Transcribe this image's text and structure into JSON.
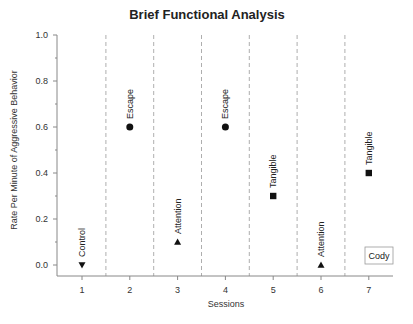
{
  "chart_data": {
    "type": "scatter",
    "title": "Brief Functional Analysis",
    "xlabel": "Sessions",
    "ylabel": "Rate Per Minute of Aggressive Behavior",
    "xlim": [
      0.5,
      7.5
    ],
    "ylim": [
      0.0,
      1.0
    ],
    "x_ticks": [
      "1",
      "2",
      "3",
      "4",
      "5",
      "6",
      "7"
    ],
    "y_ticks": [
      "0.0",
      "0.2",
      "0.4",
      "0.6",
      "0.8",
      "1.0"
    ],
    "y_tick_values": [
      0.0,
      0.2,
      0.4,
      0.6,
      0.8,
      1.0
    ],
    "grid": false,
    "phase_lines_between_sessions": true,
    "points": [
      {
        "x": 1,
        "y": 0.0,
        "condition": "Control",
        "marker": "triangle-down"
      },
      {
        "x": 2,
        "y": 0.6,
        "condition": "Escape",
        "marker": "circle"
      },
      {
        "x": 3,
        "y": 0.1,
        "condition": "Attention",
        "marker": "triangle-up"
      },
      {
        "x": 4,
        "y": 0.6,
        "condition": "Escape",
        "marker": "circle"
      },
      {
        "x": 5,
        "y": 0.3,
        "condition": "Tangible",
        "marker": "square"
      },
      {
        "x": 6,
        "y": 0.0,
        "condition": "Attention",
        "marker": "triangle-up"
      },
      {
        "x": 7,
        "y": 0.4,
        "condition": "Tangible",
        "marker": "square"
      }
    ],
    "legend": {
      "label": "Cody",
      "placement": "bottom-right"
    }
  }
}
